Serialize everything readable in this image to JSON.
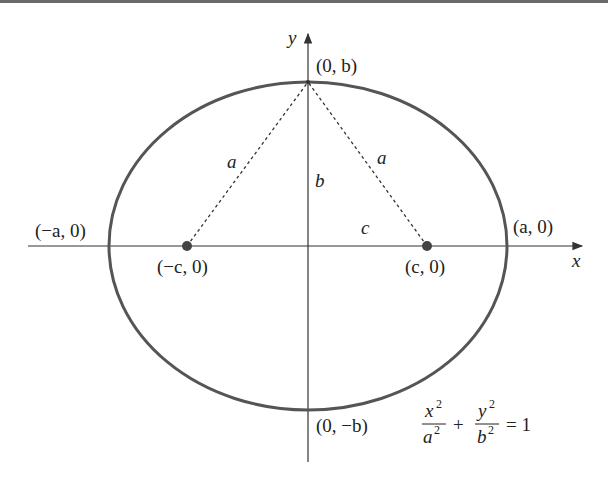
{
  "figure": {
    "type": "ellipse-diagram",
    "colors": {
      "ellipse": "#555555",
      "axes": "#333333",
      "dashed": "#333333",
      "foci": "#444444",
      "text": "#222222",
      "topbar": "#6a6a6a"
    },
    "axes": {
      "x_label": "x",
      "y_label": "y"
    },
    "vertices": {
      "top": "(0, b)",
      "bottom": "(0, −b)",
      "left": "(−a, 0)",
      "right": "(a, 0)"
    },
    "foci": {
      "left": "(−c, 0)",
      "right": "(c, 0)"
    },
    "segment_labels": {
      "left_hyp": "a",
      "right_hyp": "a",
      "vertical": "b",
      "horizontal": "c"
    },
    "equation": {
      "num1": "x",
      "den1": "a",
      "num2": "y",
      "den2": "b",
      "exp": "2",
      "plus": "+",
      "equals": "= 1"
    }
  }
}
